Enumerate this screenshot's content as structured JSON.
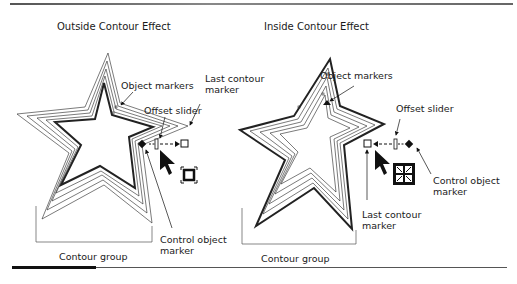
{
  "figure": {
    "left_panel": {
      "title": "Outside Contour Effect",
      "callouts": {
        "object_markers": "Object markers",
        "offset_slider": "Offset slider",
        "last_contour_marker_line1": "Last contour",
        "last_contour_marker_line2": "marker",
        "control_object_marker_line1": "Control object",
        "control_object_marker_line2": "marker",
        "contour_group": "Contour group"
      },
      "cursor_icon": "contour-outside-cursor-icon"
    },
    "right_panel": {
      "title": "Inside Contour Effect",
      "callouts": {
        "object_markers": "Object markers",
        "offset_slider": "Offset slider",
        "last_contour_marker_line1": "Last contour",
        "last_contour_marker_line2": "marker",
        "control_object_marker_line1": "Control object",
        "control_object_marker_line2": "marker",
        "contour_group": "Contour group"
      },
      "cursor_icon": "contour-inside-cursor-icon"
    }
  }
}
